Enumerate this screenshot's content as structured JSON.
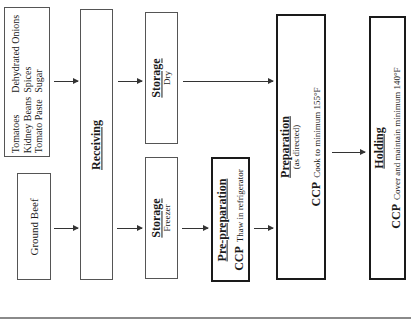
{
  "diagram": {
    "orientation": "rotated 90deg counter-clockwise",
    "nodes": {
      "ingredients": {
        "rows": [
          [
            "Tomatoes",
            "Dehydrated Onions"
          ],
          [
            "Kidney Beans",
            "Spices"
          ],
          [
            "Tomato Paste",
            "Sugar"
          ]
        ]
      },
      "ground_beef": {
        "label": "Ground Beef"
      },
      "receiving": {
        "title": "Receiving"
      },
      "storage_dry": {
        "title": "Storage",
        "sub": "Dry"
      },
      "storage_freezer": {
        "title": "Storage",
        "sub": "Freezer"
      },
      "pre_preparation": {
        "title": "Pre-preparation",
        "ccp": "CCP",
        "note": "Thaw in refrigerator"
      },
      "preparation": {
        "title": "Preparation",
        "sub": "(as directed)",
        "ccp": "CCP",
        "note": "Cook to minimum 155°F"
      },
      "holding": {
        "title": "Holding",
        "ccp": "CCP",
        "note": "Cover and maintain minimum 140°F"
      }
    },
    "edges": [
      [
        "ingredients",
        "receiving"
      ],
      [
        "ground_beef",
        "receiving"
      ],
      [
        "receiving",
        "storage_dry"
      ],
      [
        "receiving",
        "storage_freezer"
      ],
      [
        "storage_dry",
        "preparation"
      ],
      [
        "storage_freezer",
        "pre_preparation"
      ],
      [
        "pre_preparation",
        "preparation"
      ],
      [
        "preparation",
        "holding"
      ]
    ]
  }
}
